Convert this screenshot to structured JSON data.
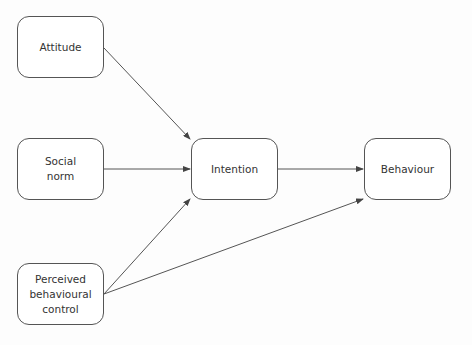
{
  "diagram": {
    "nodes": [
      {
        "id": "attitude",
        "label": "Attitude",
        "x": 17,
        "y": 16,
        "w": 87,
        "h": 62
      },
      {
        "id": "social-norm",
        "label": "Social\nnorm",
        "x": 17,
        "y": 138,
        "w": 87,
        "h": 62
      },
      {
        "id": "pbc",
        "label": "Perceived\nbehavioural\ncontrol",
        "x": 17,
        "y": 263,
        "w": 87,
        "h": 62
      },
      {
        "id": "intention",
        "label": "Intention",
        "x": 191,
        "y": 138,
        "w": 87,
        "h": 62
      },
      {
        "id": "behaviour",
        "label": "Behaviour",
        "x": 364,
        "y": 138,
        "w": 87,
        "h": 62
      }
    ],
    "edges": [
      {
        "from": "attitude",
        "to": "intention",
        "x1": 104,
        "y1": 48,
        "x2": 190,
        "y2": 139
      },
      {
        "from": "social-norm",
        "to": "intention",
        "x1": 104,
        "y1": 169,
        "x2": 190,
        "y2": 169
      },
      {
        "from": "pbc",
        "to": "intention",
        "x1": 104,
        "y1": 294,
        "x2": 190,
        "y2": 199
      },
      {
        "from": "intention",
        "to": "behaviour",
        "x1": 278,
        "y1": 169,
        "x2": 363,
        "y2": 169
      },
      {
        "from": "pbc",
        "to": "behaviour",
        "x1": 104,
        "y1": 294,
        "x2": 363,
        "y2": 199
      }
    ],
    "colors": {
      "stroke": "#555555",
      "text": "#333333"
    }
  }
}
